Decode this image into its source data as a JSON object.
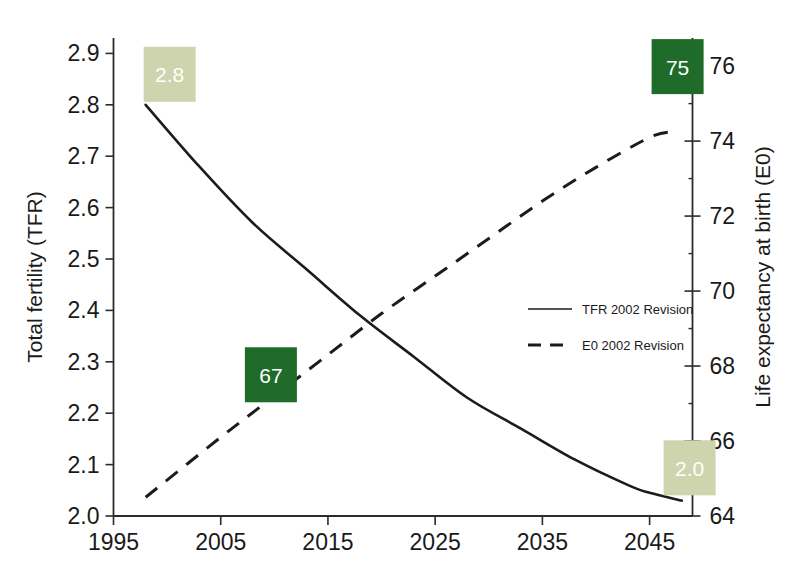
{
  "chart_data": {
    "type": "line",
    "title": "",
    "subtitle": "",
    "xlabel": "",
    "ylabel": "Total fertility (TFR)",
    "y2label": "Life expectancy at birth (E0)",
    "xlim": [
      1995,
      2049
    ],
    "ylim": [
      2.0,
      2.93
    ],
    "y2lim": [
      64.0,
      76.75
    ],
    "grid": false,
    "legend_position": "center-right",
    "x_ticks": [
      "1995",
      "2005",
      "2015",
      "2025",
      "2035",
      "2045"
    ],
    "x_tick_values": [
      1995,
      2005,
      2015,
      2025,
      2035,
      2045
    ],
    "y_ticks": [
      "2.0",
      "2.1",
      "2.2",
      "2.3",
      "2.4",
      "2.5",
      "2.6",
      "2.7",
      "2.8",
      "2.9"
    ],
    "y_tick_values": [
      2.0,
      2.1,
      2.2,
      2.3,
      2.4,
      2.5,
      2.6,
      2.7,
      2.8,
      2.9
    ],
    "y2_ticks": [
      "64",
      "66",
      "68",
      "70",
      "72",
      "74",
      "76"
    ],
    "y2_tick_values": [
      64,
      66,
      68,
      70,
      72,
      74,
      76
    ],
    "y2_minor_tick_values": [
      65,
      67,
      69,
      71,
      73,
      75
    ],
    "series": [
      {
        "name": "TFR 2002 Revision",
        "axis": "left",
        "style": "solid",
        "color": "#1c1c1c",
        "x": [
          1998,
          2003,
          2008,
          2013,
          2018,
          2023,
          2028,
          2033,
          2038,
          2043,
          2045,
          2048
        ],
        "values": [
          2.8,
          2.68,
          2.57,
          2.48,
          2.39,
          2.31,
          2.23,
          2.17,
          2.11,
          2.06,
          2.045,
          2.03
        ]
      },
      {
        "name": "E0 2002 Revision",
        "axis": "right",
        "style": "dashed",
        "color": "#1c1c1c",
        "x": [
          1998,
          2005,
          2010,
          2015,
          2020,
          2025,
          2030,
          2035,
          2040,
          2045,
          2047
        ],
        "values": [
          64.5,
          66.1,
          67.2,
          68.3,
          69.4,
          70.4,
          71.4,
          72.4,
          73.3,
          74.1,
          74.25
        ]
      }
    ],
    "annotations": [
      {
        "label": "2.8",
        "series": "TFR 2002 Revision",
        "x": 1998,
        "value": 2.8,
        "axis": "left",
        "style": "light"
      },
      {
        "label": "2.0",
        "series": "TFR 2002 Revision",
        "x": 2045,
        "value": 2.05,
        "axis": "left",
        "style": "light"
      },
      {
        "label": "67",
        "series": "E0 2002 Revision",
        "x": 2008,
        "value": 66.9,
        "axis": "right",
        "style": "dark"
      },
      {
        "label": "75",
        "series": "E0 2002 Revision",
        "x": 2045,
        "value": 75.2,
        "axis": "right",
        "style": "dark"
      }
    ],
    "legend": [
      {
        "label": "TFR 2002 Revision",
        "style": "solid"
      },
      {
        "label": "E0 2002 Revision",
        "style": "dashed"
      }
    ],
    "colors": {
      "line": "#1c1c1c",
      "axis": "#2b2b2b",
      "callout_light": "#cdd4ae",
      "callout_dark": "#1e6b2a",
      "callout_text": "#ffffff",
      "background": "#ffffff"
    }
  }
}
